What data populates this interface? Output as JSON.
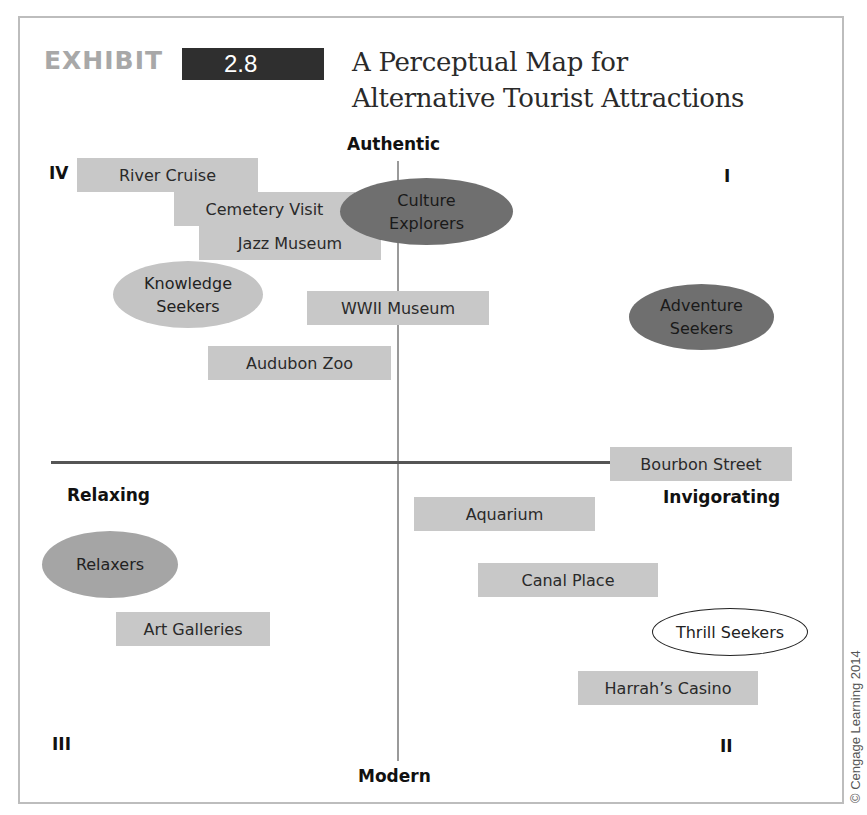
{
  "header": {
    "exhibit_label": "EXHIBIT",
    "exhibit_number": "2.8",
    "title_line1": "A Perceptual Map for",
    "title_line2": "Alternative Tourist Attractions"
  },
  "axes": {
    "top": "Authentic",
    "bottom": "Modern",
    "left": "Relaxing",
    "right": "Invigorating"
  },
  "quadrants": {
    "q1": "I",
    "q2": "II",
    "q3": "III",
    "q4": "IV"
  },
  "attractions": [
    {
      "label": "River Cruise"
    },
    {
      "label": "Cemetery Visit"
    },
    {
      "label": "Jazz Museum"
    },
    {
      "label": "WWII Museum"
    },
    {
      "label": "Audubon Zoo"
    },
    {
      "label": "Bourbon Street"
    },
    {
      "label": "Aquarium"
    },
    {
      "label": "Canal Place"
    },
    {
      "label": "Art Galleries"
    },
    {
      "label": "Harrah’s Casino"
    }
  ],
  "segments": [
    {
      "line1": "Culture",
      "line2": "Explorers",
      "style": "dark"
    },
    {
      "line1": "Knowledge",
      "line2": "Seekers",
      "style": "light"
    },
    {
      "line1": "Adventure",
      "line2": "Seekers",
      "style": "dark"
    },
    {
      "line1": "Relaxers",
      "line2": "",
      "style": "medium"
    },
    {
      "line1": "Thrill Seekers",
      "line2": "",
      "style": "outline"
    }
  ],
  "credit": "© Cengage Learning 2014",
  "colors": {
    "box_fill": "#c8c8c8",
    "ellipse_dark": "#6f6f6f",
    "ellipse_medium": "#a5a5a5",
    "ellipse_light": "#c4c4c4",
    "exhibit_badge": "#2f2f2f",
    "exhibit_text": "#a8a8a8"
  }
}
